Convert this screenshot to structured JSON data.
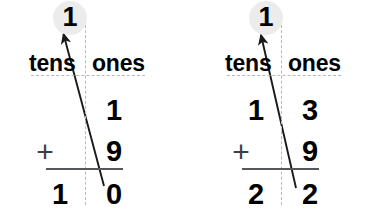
{
  "worksheet": {
    "title": "Two-digit addition with regrouping",
    "background_color": "#ffffff",
    "ink_color": "#000000",
    "guide_color": "#b8b8b8",
    "rule_color": "#55585a",
    "halo_color": "#ececec"
  },
  "problems": [
    {
      "id": "problem-left",
      "headers": {
        "tens": "tens",
        "ones": "ones"
      },
      "carry": {
        "value": "1",
        "column": "tens",
        "from_column": "ones"
      },
      "addend1": {
        "tens": "",
        "ones": "1"
      },
      "operator": "+",
      "addend2": {
        "tens": "",
        "ones": "9"
      },
      "sum": {
        "tens": "1",
        "ones": "0"
      },
      "expression": "1 + 9 = 10"
    },
    {
      "id": "problem-right",
      "headers": {
        "tens": "tens",
        "ones": "ones"
      },
      "carry": {
        "value": "1",
        "column": "tens",
        "from_column": "ones"
      },
      "addend1": {
        "tens": "1",
        "ones": "3"
      },
      "operator": "+",
      "addend2": {
        "tens": "",
        "ones": "9"
      },
      "sum": {
        "tens": "2",
        "ones": "2"
      },
      "expression": "13 + 9 = 22"
    }
  ],
  "icons": {
    "carry_arrow": "up-arrow-icon",
    "column_divider": "dashed-vertical-divider",
    "header_divider": "dashed-horizontal-divider"
  }
}
